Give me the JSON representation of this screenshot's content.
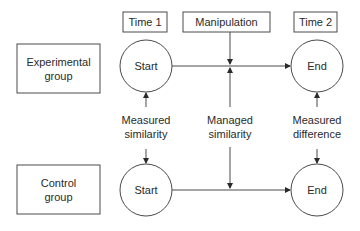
{
  "diagram": {
    "time_labels": {
      "time1": "Time 1",
      "manipulation": "Manipulation",
      "time2": "Time 2"
    },
    "groups": {
      "experimental": {
        "line1": "Experimental",
        "line2": "group"
      },
      "control": {
        "line1": "Control",
        "line2": "group"
      }
    },
    "nodes": {
      "exp_start": "Start",
      "exp_end": "End",
      "ctrl_start": "Start",
      "ctrl_end": "End"
    },
    "links": {
      "measured_similarity": {
        "line1": "Measured",
        "line2": "similarity"
      },
      "managed_similarity": {
        "line1": "Managed",
        "line2": "similarity"
      },
      "measured_difference": {
        "line1": "Measured",
        "line2": "difference"
      }
    },
    "colors": {
      "stroke": "#4a4a4a",
      "text": "#2a2a2a",
      "background": "#ffffff"
    }
  }
}
